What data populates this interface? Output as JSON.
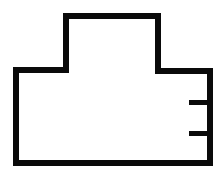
{
  "diagram": {
    "type": "outline-shape",
    "colors": {
      "stroke": "#0a0a0a",
      "background": "#ffffff"
    },
    "stroke_width": 6,
    "outline_points": [
      [
        16,
        70
      ],
      [
        66,
        70
      ],
      [
        66,
        16
      ],
      [
        158,
        16
      ],
      [
        158,
        71
      ],
      [
        210,
        71
      ],
      [
        210,
        163
      ],
      [
        16,
        163
      ]
    ],
    "ticks": [
      {
        "x1": 189,
        "x2": 210,
        "y": 102.5
      },
      {
        "x1": 189,
        "x2": 210,
        "y": 133.5
      }
    ]
  }
}
